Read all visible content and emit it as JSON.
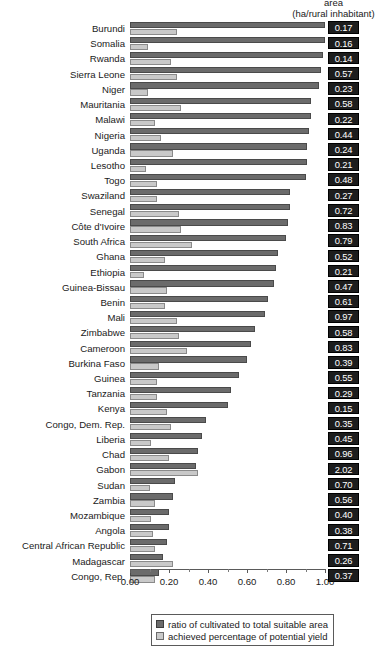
{
  "header": {
    "line1": "area",
    "line2": "(ha/rural inhabitant)"
  },
  "legend": {
    "items": [
      {
        "key": "ratio",
        "label": "ratio of cultivated to total suitable area",
        "color": "#6b6b6b"
      },
      {
        "key": "yield",
        "label": "achieved percentage of potential yield",
        "color": "#c9c9c9"
      }
    ]
  },
  "axis": {
    "ticks": [
      "0.00",
      "0.20",
      "0.40",
      "0.60",
      "0.80",
      "1.00"
    ],
    "min": 0,
    "max": 1.0
  },
  "chart_data": {
    "type": "bar",
    "orientation": "horizontal",
    "title": "",
    "xlabel": "",
    "ylabel": "",
    "xlim": [
      0,
      1.0
    ],
    "grid": false,
    "legend_position": "bottom",
    "value_column_header": "area (ha/rural inhabitant)",
    "categories": [
      "Burundi",
      "Somalia",
      "Rwanda",
      "Sierra Leone",
      "Niger",
      "Mauritania",
      "Malawi",
      "Nigeria",
      "Uganda",
      "Lesotho",
      "Togo",
      "Swaziland",
      "Senegal",
      "Côte d'Ivoire",
      "South Africa",
      "Ghana",
      "Ethiopia",
      "Guinea-Bissau",
      "Benin",
      "Mali",
      "Zimbabwe",
      "Cameroon",
      "Burkina Faso",
      "Guinea",
      "Tanzania",
      "Kenya",
      "Congo, Dem. Rep.",
      "Liberia",
      "Chad",
      "Gabon",
      "Sudan",
      "Zambia",
      "Mozambique",
      "Angola",
      "Central African Republic",
      "Madagascar",
      "Congo, Rep."
    ],
    "series": [
      {
        "name": "ratio of cultivated to total suitable area",
        "color": "#6b6b6b",
        "values": [
          1.0,
          1.0,
          0.99,
          0.98,
          0.97,
          0.93,
          0.93,
          0.92,
          0.91,
          0.91,
          0.9,
          0.82,
          0.82,
          0.81,
          0.8,
          0.76,
          0.75,
          0.74,
          0.71,
          0.69,
          0.64,
          0.62,
          0.6,
          0.56,
          0.52,
          0.5,
          0.39,
          0.37,
          0.35,
          0.34,
          0.23,
          0.22,
          0.2,
          0.2,
          0.19,
          0.17,
          0.15
        ]
      },
      {
        "name": "achieved percentage of potential yield",
        "color": "#c9c9c9",
        "values": [
          0.24,
          0.09,
          0.21,
          0.24,
          0.09,
          0.26,
          0.13,
          0.16,
          0.22,
          0.08,
          0.14,
          0.14,
          0.25,
          0.26,
          0.32,
          0.18,
          0.07,
          0.19,
          0.18,
          0.24,
          0.25,
          0.29,
          0.15,
          0.14,
          0.14,
          0.19,
          0.21,
          0.11,
          0.2,
          0.35,
          0.1,
          0.13,
          0.11,
          0.12,
          0.13,
          0.22,
          0.13
        ]
      }
    ],
    "value_labels": [
      "0.17",
      "0.16",
      "0.14",
      "0.57",
      "0.23",
      "0.58",
      "0.22",
      "0.44",
      "0.24",
      "0.21",
      "0.48",
      "0.27",
      "0.72",
      "0.83",
      "0.79",
      "0.52",
      "0.21",
      "0.47",
      "0.61",
      "0.97",
      "0.58",
      "0.83",
      "0.39",
      "0.55",
      "0.29",
      "0.15",
      "0.35",
      "0.45",
      "0.96",
      "2.02",
      "0.70",
      "0.56",
      "0.40",
      "0.38",
      "0.71",
      "0.26",
      "0.37"
    ]
  }
}
